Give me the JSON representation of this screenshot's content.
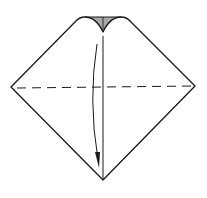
{
  "diagram": {
    "type": "origami-fold-step",
    "colors": {
      "background": "#ffffff",
      "stroke": "#1a1a1a",
      "shaded_flap": "#a8a8a8"
    },
    "elements": {
      "paper_outline": "diamond",
      "fold_line": "dashed-horizontal",
      "center_crease": "vertical-line",
      "arrow": "curved-down-arrow",
      "shaded_flap": "top-notch"
    }
  }
}
